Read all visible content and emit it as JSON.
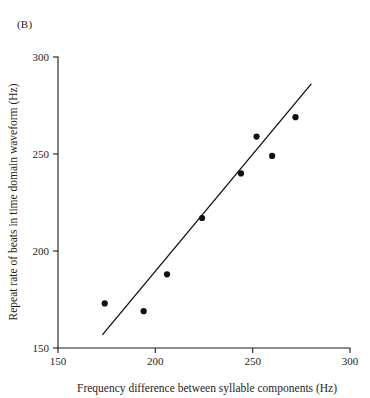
{
  "figure": {
    "panel_label": "(B)"
  },
  "chart_data": {
    "type": "scatter",
    "title": "",
    "xlabel": "Frequency difference between syllable components (Hz)",
    "ylabel": "Repeat rate of beats in time domain waveform (Hz)",
    "xlim": [
      150,
      300
    ],
    "ylim": [
      150,
      300
    ],
    "xticks": [
      150,
      200,
      250,
      300
    ],
    "yticks": [
      150,
      200,
      250,
      300
    ],
    "xtick_labels": [
      "150",
      "200",
      "250",
      "300"
    ],
    "ytick_labels": [
      "150",
      "200",
      "250",
      "300"
    ],
    "grid": false,
    "legend": "none",
    "points": [
      {
        "x": 174,
        "y": 173
      },
      {
        "x": 194,
        "y": 169
      },
      {
        "x": 206,
        "y": 188
      },
      {
        "x": 224,
        "y": 217
      },
      {
        "x": 244,
        "y": 240
      },
      {
        "x": 252,
        "y": 259
      },
      {
        "x": 260,
        "y": 249
      },
      {
        "x": 272,
        "y": 269
      }
    ],
    "fit_line": {
      "type": "linear-regression",
      "x_start": 173,
      "y_start": 157,
      "x_end": 280,
      "y_end": 286
    }
  }
}
